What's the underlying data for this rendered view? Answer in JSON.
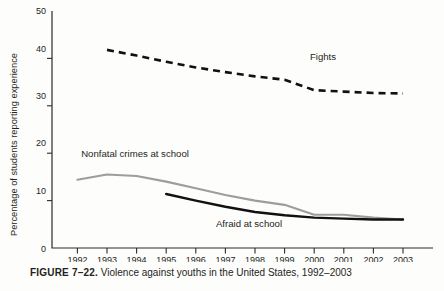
{
  "caption": {
    "figure_label": "FIGURE 7–22.",
    "figure_text": " Violence against youths in the United States, 1992–2003"
  },
  "chart_data": {
    "type": "line",
    "title": "",
    "xlabel": "",
    "ylabel": "Percentage of students reporting experience",
    "xlim": [
      1991.5,
      2003.5
    ],
    "ylim": [
      0,
      50
    ],
    "grid": false,
    "legend_position": "inline-annotations",
    "x": [
      1992,
      1993,
      1994,
      1995,
      1996,
      1997,
      1998,
      1999,
      2000,
      2001,
      2002,
      2003
    ],
    "xtick_labels": [
      "1992",
      "1993",
      "1994",
      "1995",
      "1996",
      "1997",
      "1998",
      "1999",
      "2000",
      "2001",
      "2002",
      "2003"
    ],
    "ytick_labels": [
      "0",
      "10",
      "20",
      "30",
      "40",
      "50"
    ],
    "yticks": [
      0,
      10,
      20,
      30,
      40,
      50
    ],
    "series": [
      {
        "name": "Fights",
        "style": "dashed",
        "color": "#111111",
        "x": [
          1993,
          1994,
          1995,
          1996,
          1997,
          1998,
          1999,
          2000,
          2001,
          2002,
          2003
        ],
        "values": [
          41.8,
          40.6,
          39.3,
          38.1,
          37.1,
          36.2,
          35.5,
          33.3,
          33.0,
          32.7,
          32.6
        ],
        "label_text": "Fights"
      },
      {
        "name": "Nonfatal crimes at school",
        "style": "solid",
        "color": "#9d9d9d",
        "x": [
          1992,
          1993,
          1994,
          1995,
          1996,
          1997,
          1998,
          1999,
          2000,
          2001,
          2002,
          2003
        ],
        "values": [
          14.4,
          15.5,
          15.2,
          14.0,
          12.6,
          11.2,
          10.0,
          9.1,
          7.0,
          7.0,
          6.4,
          6.0
        ],
        "label_text": "Nonfatal crimes at school"
      },
      {
        "name": "Afraid at school",
        "style": "solid",
        "color": "#111111",
        "x": [
          1995,
          1996,
          1997,
          1998,
          1999,
          2000,
          2001,
          2002,
          2003
        ],
        "values": [
          11.4,
          10.0,
          8.7,
          7.6,
          6.9,
          6.4,
          6.2,
          6.0,
          6.0
        ],
        "label_text": "Afraid at school"
      }
    ]
  }
}
